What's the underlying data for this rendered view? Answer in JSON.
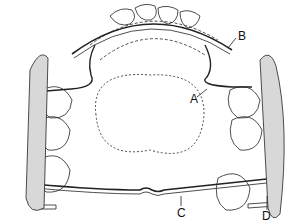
{
  "diagram": {
    "type": "dental appliance (maxillary arch, occlusal view)",
    "labels": [
      {
        "id": "A",
        "text": "A"
      },
      {
        "id": "B",
        "text": "B"
      },
      {
        "id": "C",
        "text": "C"
      },
      {
        "id": "D",
        "text": "D"
      }
    ]
  }
}
